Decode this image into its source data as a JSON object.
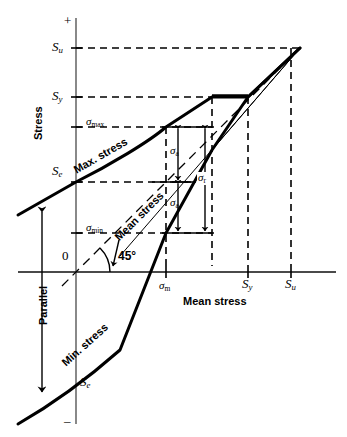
{
  "figure": {
    "type": "engineering-diagram",
    "axes": {
      "y_axis_label": "Stress",
      "x_axis_label": "Mean stress",
      "origin_label": "0",
      "positive_sign": "+",
      "negative_sign": "–"
    },
    "y_ticks": [
      {
        "label_main": "S",
        "label_sub": "u",
        "name": "ultimate-strength"
      },
      {
        "label_main": "S",
        "label_sub": "y",
        "name": "yield-strength"
      },
      {
        "label_main": "σ",
        "label_sub": "max",
        "name": "max-stress-level"
      },
      {
        "label_main": "S",
        "label_sub": "e",
        "name": "endurance-limit-upper"
      },
      {
        "label_main": "σ",
        "label_sub": "min",
        "name": "min-stress-level"
      },
      {
        "label_main": "S",
        "label_sub": "e",
        "name": "endurance-limit-lower"
      }
    ],
    "x_ticks": [
      {
        "label_main": "σ",
        "label_sub": "m",
        "name": "mean-stress-value"
      },
      {
        "label_main": "S",
        "label_sub": "y",
        "name": "yield-strength-x"
      },
      {
        "label_main": "S",
        "label_sub": "u",
        "name": "ultimate-strength-x"
      }
    ],
    "curve_labels": [
      {
        "text": "Max. stress",
        "name": "max-stress-curve-label"
      },
      {
        "text": "Mean stress",
        "name": "mean-stress-line-label"
      },
      {
        "text": "Min. stress",
        "name": "min-stress-curve-label"
      }
    ],
    "annotations": [
      {
        "label_main": "σ",
        "label_sub": "a",
        "name": "alternating-stress-upper"
      },
      {
        "label_main": "σ",
        "label_sub": "a",
        "name": "alternating-stress-lower"
      },
      {
        "label_main": "σ",
        "label_sub": "r",
        "name": "stress-range"
      },
      {
        "text": "45°",
        "name": "angle-label"
      },
      {
        "text": "Parallel",
        "name": "parallel-label"
      }
    ],
    "colors": {
      "line": "#000000",
      "axis": "#555555",
      "background": "#ffffff"
    }
  }
}
